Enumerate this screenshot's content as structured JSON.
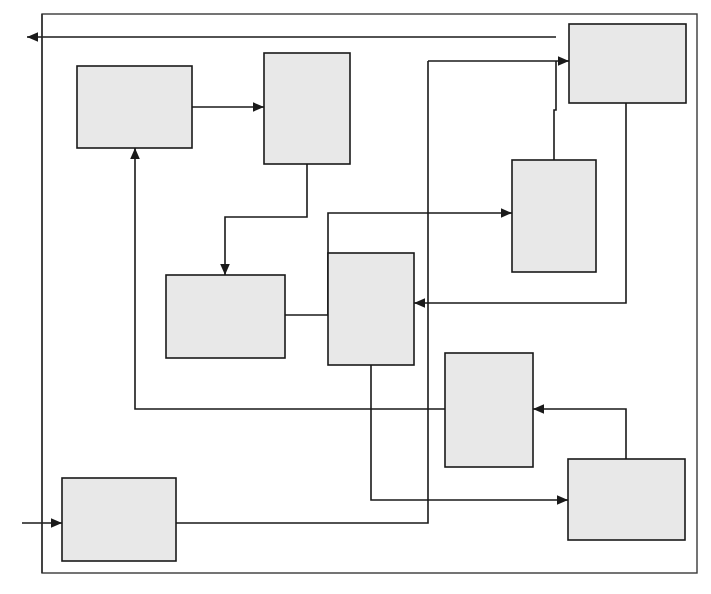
{
  "figure": {
    "kind": "block-diagram",
    "title": "",
    "caption": "",
    "background_color": "#ffffff",
    "block_fill_color": "#e8e8e8",
    "line_color": "#1a1a1a",
    "frame_color": "#3a3a3a",
    "width": 711,
    "height": 594
  },
  "frame": {
    "label": "",
    "x": 42,
    "y": 14,
    "width": 655,
    "height": 559
  },
  "blocks": [
    {
      "id": "block-1",
      "label": "",
      "x": 77,
      "y": 66,
      "width": 115,
      "height": 82
    },
    {
      "id": "block-2",
      "label": "",
      "x": 264,
      "y": 53,
      "width": 86,
      "height": 111
    },
    {
      "id": "block-3",
      "label": "",
      "x": 569,
      "y": 24,
      "width": 117,
      "height": 79
    },
    {
      "id": "block-4",
      "label": "",
      "x": 512,
      "y": 160,
      "width": 84,
      "height": 112
    },
    {
      "id": "block-5",
      "label": "",
      "x": 166,
      "y": 275,
      "width": 119,
      "height": 83
    },
    {
      "id": "block-6",
      "label": "",
      "x": 328,
      "y": 253,
      "width": 86,
      "height": 112
    },
    {
      "id": "block-7",
      "label": "",
      "x": 445,
      "y": 353,
      "width": 88,
      "height": 114
    },
    {
      "id": "block-8",
      "label": "",
      "x": 568,
      "y": 459,
      "width": 117,
      "height": 81
    },
    {
      "id": "block-9",
      "label": "",
      "x": 62,
      "y": 478,
      "width": 114,
      "height": 83
    }
  ],
  "connections": [
    {
      "id": "conn-in",
      "label": "external-input",
      "from": "external-left",
      "to": "block-9",
      "arrow": true
    },
    {
      "id": "conn-out",
      "label": "external-output",
      "from": "frame-loop",
      "to": "external-left",
      "arrow": true
    },
    {
      "id": "conn-1-2",
      "label": "",
      "from": "block-1",
      "to": "block-2",
      "arrow": true
    },
    {
      "id": "conn-2-5",
      "label": "",
      "from": "block-2",
      "to": "block-5",
      "arrow": true
    },
    {
      "id": "conn-5-6",
      "label": "",
      "from": "block-5",
      "to": "block-6",
      "arrow": false
    },
    {
      "id": "conn-6-4",
      "label": "",
      "from": "block-6",
      "to": "block-4",
      "arrow": true
    },
    {
      "id": "conn-3-6",
      "label": "",
      "from": "block-3",
      "to": "block-6",
      "arrow": true
    },
    {
      "id": "conn-4-3",
      "label": "",
      "from": "block-4",
      "to": "block-3",
      "arrow": true
    },
    {
      "id": "conn-6-8",
      "label": "",
      "from": "block-6",
      "to": "block-8",
      "arrow": true
    },
    {
      "id": "conn-9-3",
      "label": "",
      "from": "block-9",
      "to": "block-3",
      "arrow": true
    },
    {
      "id": "conn-7-1",
      "label": "",
      "from": "block-7",
      "to": "block-1",
      "arrow": true
    },
    {
      "id": "conn-8-7",
      "label": "",
      "from": "block-8",
      "to": "block-7",
      "arrow": true
    }
  ],
  "arrow_markers": {
    "count": 9,
    "style": "solid-triangle"
  }
}
